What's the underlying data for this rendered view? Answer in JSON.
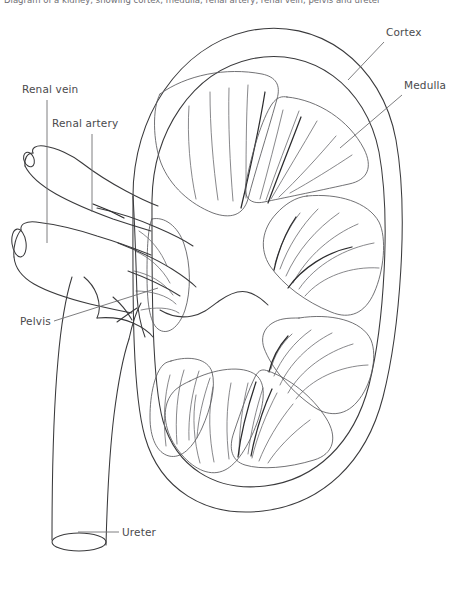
{
  "figure": {
    "background_color": "#ffffff",
    "line_color": "#3a3a3c",
    "label_color": "#4a4a4d",
    "width": 455,
    "height": 590
  },
  "header": {
    "cropped_caption": "Diagram of a kidney, showing cortex, medulla, renal artery, renal vein, pelvis and ureter"
  },
  "labels": [
    {
      "id": "cortex",
      "text": "Cortex",
      "text_x": 386,
      "text_y": 36,
      "leader_from_x": 384,
      "leader_from_y": 42,
      "leader_to_x": 348,
      "leader_to_y": 80,
      "side": "right"
    },
    {
      "id": "medulla",
      "text": "Medulla",
      "text_x": 404,
      "text_y": 89,
      "leader_from_x": 402,
      "leader_from_y": 95,
      "leader_to_x": 340,
      "leader_to_y": 148,
      "side": "right"
    },
    {
      "id": "renal-vein",
      "text": "Renal vein",
      "text_x": 22,
      "text_y": 93,
      "leader_from_x": 47,
      "leader_from_y": 100,
      "leader_to_x": 47,
      "leader_to_y": 243,
      "side": "left"
    },
    {
      "id": "renal-artery",
      "text": "Renal artery",
      "text_x": 52,
      "text_y": 127,
      "leader_from_x": 92,
      "leader_from_y": 134,
      "leader_to_x": 92,
      "leader_to_y": 212,
      "side": "left"
    },
    {
      "id": "pelvis",
      "text": "Pelvis",
      "text_x": 20,
      "text_y": 325,
      "leader_from_x": 54,
      "leader_from_y": 321,
      "leader_to_x": 158,
      "leader_to_y": 288,
      "side": "left"
    },
    {
      "id": "ureter",
      "text": "Ureter",
      "text_x": 122,
      "text_y": 536,
      "leader_from_x": 119,
      "leader_from_y": 532,
      "leader_to_x": 78,
      "leader_to_y": 532,
      "side": "bottom"
    }
  ],
  "structures": [
    {
      "id": "renal-capsule",
      "name": "Renal capsule (outer kidney outline)"
    },
    {
      "id": "cortex-band",
      "name": "Renal cortex band"
    },
    {
      "id": "medullary-pyramids",
      "name": "Medullary pyramids with radial striations",
      "count": 8
    },
    {
      "id": "renal-pelvis",
      "name": "Renal pelvis (central cavity)"
    },
    {
      "id": "renal-artery",
      "name": "Renal artery (upper vessel at hilum)"
    },
    {
      "id": "renal-vein",
      "name": "Renal vein (lower vessel at hilum)"
    },
    {
      "id": "ureter",
      "name": "Ureter (descending tube)"
    }
  ]
}
